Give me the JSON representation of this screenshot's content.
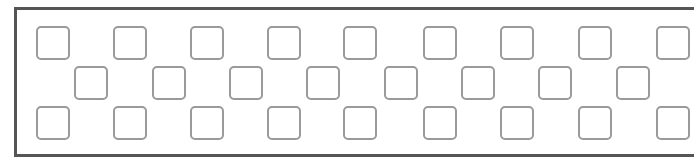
{
  "diagram": {
    "frame": {
      "left": 14,
      "top": 7,
      "width": 680,
      "height": 150,
      "border_color": "#555555"
    },
    "square": {
      "size": 34,
      "border_color": "#9a9a9a"
    },
    "rows": [
      {
        "name": "top",
        "y": 26,
        "xs": [
          36,
          113,
          190,
          267,
          343,
          423,
          500,
          578,
          656
        ]
      },
      {
        "name": "middle",
        "y": 66,
        "xs": [
          74,
          152,
          229,
          306,
          384,
          461,
          538,
          616
        ]
      },
      {
        "name": "bottom",
        "y": 106,
        "xs": [
          36,
          113,
          190,
          267,
          343,
          423,
          500,
          578,
          656
        ]
      }
    ]
  }
}
